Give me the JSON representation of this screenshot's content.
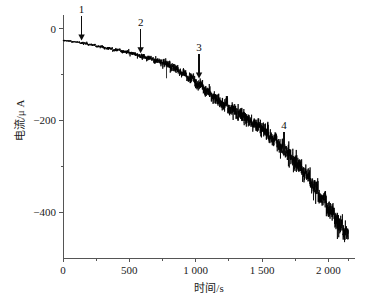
{
  "chart_data": {
    "type": "line",
    "title": "",
    "xlabel": "时间/s",
    "ylabel": "电流/μ A",
    "xlim": [
      0,
      2200
    ],
    "ylim": [
      -500,
      30
    ],
    "grid": false,
    "legend": null,
    "x_ticks": [
      {
        "value": 0,
        "label": "0"
      },
      {
        "value": 500,
        "label": "500"
      },
      {
        "value": 1000,
        "label": "1 000"
      },
      {
        "value": 1500,
        "label": "1 500"
      },
      {
        "value": 2000,
        "label": "2 000"
      }
    ],
    "x_minor_ticks": [
      250,
      750,
      1250,
      1750,
      2150
    ],
    "y_ticks": [
      {
        "value": 0,
        "label": "0"
      },
      {
        "value": -200,
        "label": "−200"
      },
      {
        "value": -400,
        "label": "−400"
      }
    ],
    "y_minor_ticks": [
      -100,
      -300
    ],
    "series": [
      {
        "name": "current-time-trace",
        "color": "#000000",
        "description": "noisy descending staircase chronoamperometric current trace",
        "x": [
          0,
          50,
          100,
          150,
          200,
          250,
          300,
          350,
          400,
          450,
          500,
          550,
          600,
          650,
          700,
          750,
          800,
          850,
          900,
          950,
          1000,
          1050,
          1100,
          1150,
          1200,
          1250,
          1300,
          1350,
          1400,
          1450,
          1500,
          1550,
          1600,
          1650,
          1700,
          1750,
          1800,
          1850,
          1900,
          1950,
          2000,
          2050,
          2100,
          2150
        ],
        "values": [
          -25,
          -27,
          -29,
          -31,
          -34,
          -37,
          -40,
          -43,
          -46,
          -49,
          -52,
          -56,
          -60,
          -64,
          -69,
          -74,
          -80,
          -88,
          -96,
          -105,
          -115,
          -127,
          -140,
          -152,
          -163,
          -172,
          -181,
          -190,
          -199,
          -208,
          -218,
          -230,
          -243,
          -257,
          -272,
          -288,
          -305,
          -325,
          -347,
          -370,
          -392,
          -412,
          -432,
          -450
        ],
        "noise_amplitude": [
          2,
          2,
          2,
          3,
          3,
          3,
          4,
          4,
          5,
          5,
          6,
          6,
          7,
          8,
          9,
          10,
          11,
          12,
          13,
          14,
          15,
          16,
          17,
          18,
          19,
          20,
          20,
          21,
          21,
          22,
          22,
          23,
          23,
          24,
          24,
          25,
          25,
          26,
          26,
          27,
          27,
          27,
          28,
          28
        ]
      }
    ],
    "annotations": [
      {
        "label": "1",
        "x": 140,
        "y_tip": -32,
        "type": "down-arrow"
      },
      {
        "label": "2",
        "x": 585,
        "y_tip": -60,
        "type": "down-arrow"
      },
      {
        "label": "3",
        "x": 1025,
        "y_tip": -115,
        "type": "down-arrow"
      },
      {
        "label": "4",
        "x": 1665,
        "y_tip": -285,
        "type": "down-arrow"
      }
    ]
  }
}
